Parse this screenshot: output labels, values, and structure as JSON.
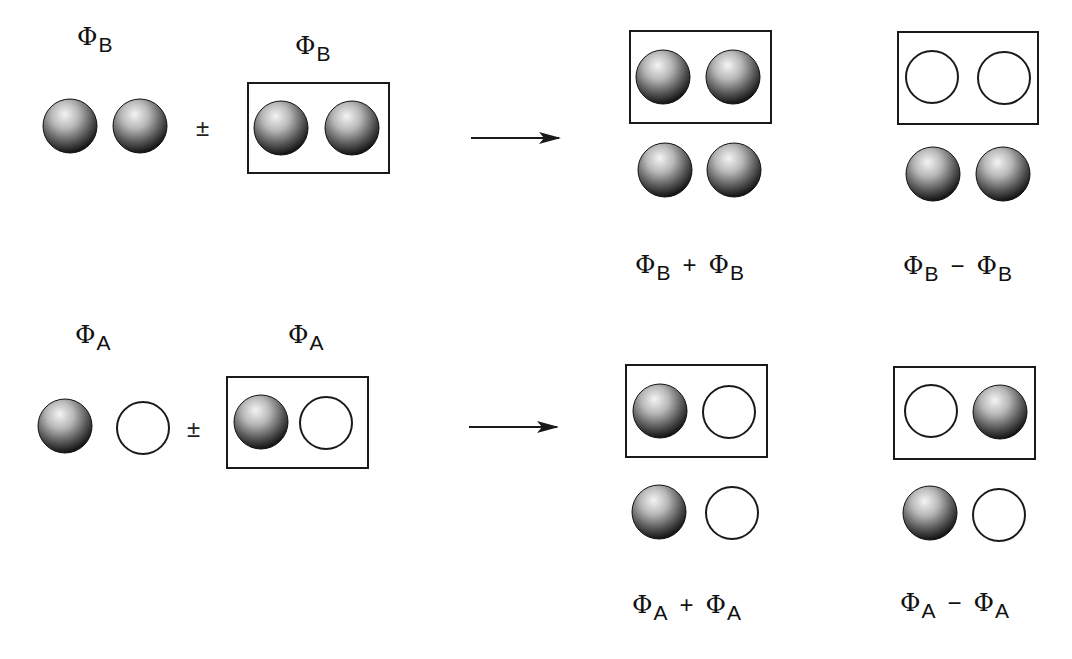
{
  "figure": {
    "colors": {
      "sphere_highlight": "#f2f2f2",
      "sphere_mid": "#8a8a8a",
      "sphere_shadow": "#0a0a0a",
      "outline": "#1a1a1a",
      "background": "#ffffff"
    },
    "row_b": {
      "left_label": {
        "symbol": "Φ",
        "subscript": "B"
      },
      "right_label": {
        "symbol": "Φ",
        "subscript": "B"
      },
      "operator": "±",
      "left_orbitals": [
        "filled",
        "filled"
      ],
      "boxed_orbitals": [
        "filled",
        "filled"
      ],
      "results": [
        {
          "boxed": [
            "filled",
            "filled"
          ],
          "unboxed": [
            "filled",
            "filled"
          ],
          "caption": {
            "a": "Φ",
            "a_sub": "B",
            "op": "+",
            "b": "Φ",
            "b_sub": "B"
          }
        },
        {
          "boxed": [
            "open",
            "open"
          ],
          "unboxed": [
            "filled",
            "filled"
          ],
          "caption": {
            "a": "Φ",
            "a_sub": "B",
            "op": "−",
            "b": "Φ",
            "b_sub": "B"
          }
        }
      ]
    },
    "row_a": {
      "left_label": {
        "symbol": "Φ",
        "subscript": "A"
      },
      "right_label": {
        "symbol": "Φ",
        "subscript": "A"
      },
      "operator": "±",
      "left_orbitals": [
        "filled",
        "open"
      ],
      "boxed_orbitals": [
        "filled",
        "open"
      ],
      "results": [
        {
          "boxed": [
            "filled",
            "open"
          ],
          "unboxed": [
            "filled",
            "open"
          ],
          "caption": {
            "a": "Φ",
            "a_sub": "A",
            "op": "+",
            "b": "Φ",
            "b_sub": "A"
          }
        },
        {
          "boxed": [
            "open",
            "filled"
          ],
          "unboxed": [
            "filled",
            "open"
          ],
          "caption": {
            "a": "Φ",
            "a_sub": "A",
            "op": "−",
            "b": "Φ",
            "b_sub": "A"
          }
        }
      ]
    }
  }
}
